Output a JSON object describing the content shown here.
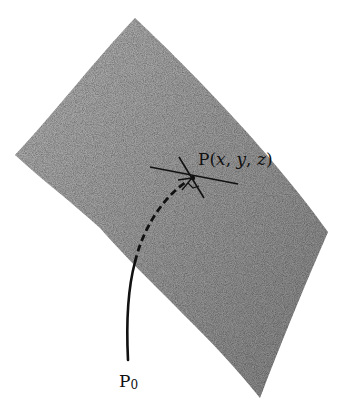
{
  "diagram": {
    "type": "surface-with-curve",
    "surface": {
      "fill_color": "#9a9a9a",
      "texture": "grainy stipple",
      "vertices": {
        "top": [
          135,
          18
        ],
        "left": [
          15,
          155
        ],
        "right": [
          328,
          232
        ],
        "bottom": [
          260,
          398
        ]
      }
    },
    "point_label": {
      "prefix": "P(",
      "x": "x",
      "sep1": ", ",
      "y": "y",
      "sep2": ", ",
      "z": "z",
      "suffix": ")"
    },
    "start_label": {
      "base": "P",
      "subscript": "0"
    },
    "curve": {
      "solid_segment": "from P0 up to surface edge",
      "dashed_segment": "on surface up to P with arrowhead",
      "color": "#111111"
    },
    "tangent_lines": [
      {
        "name": "tangent-1",
        "from": [
          150,
          167
        ],
        "to": [
          238,
          184
        ]
      },
      {
        "name": "tangent-2",
        "from": [
          179,
          157
        ],
        "to": [
          204,
          198
        ]
      }
    ]
  }
}
